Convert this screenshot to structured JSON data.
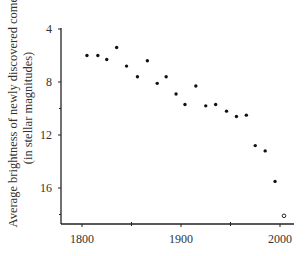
{
  "chart_data": {
    "type": "scatter",
    "title": "",
    "xlabel": "",
    "ylabel": "Average brightness of newly discovered comets (in stellar magnitudes)",
    "ylabel_lines": [
      "Average brightness of newly discovered comets",
      "(in stellar magnitudes)"
    ],
    "x_ticks": [
      1800,
      1900,
      2000
    ],
    "x_minor_ticks": [
      1850,
      1950
    ],
    "y_ticks": [
      4,
      8,
      12,
      16
    ],
    "y_minor_ticks": [
      10,
      18
    ],
    "y_inverted": true,
    "xlim": [
      1779,
      2014
    ],
    "ylim": [
      4,
      18.8
    ],
    "grid": false,
    "legend": null,
    "series": [
      {
        "name": "observed",
        "marker": "filled-circle",
        "points": [
          {
            "x": 1805,
            "y": 6.0
          },
          {
            "x": 1816,
            "y": 6.0
          },
          {
            "x": 1825,
            "y": 6.3
          },
          {
            "x": 1835,
            "y": 5.4
          },
          {
            "x": 1845,
            "y": 6.8
          },
          {
            "x": 1856,
            "y": 7.6
          },
          {
            "x": 1866,
            "y": 6.4
          },
          {
            "x": 1876,
            "y": 8.1
          },
          {
            "x": 1885,
            "y": 7.6
          },
          {
            "x": 1895,
            "y": 8.9
          },
          {
            "x": 1904,
            "y": 9.7
          },
          {
            "x": 1915,
            "y": 8.3
          },
          {
            "x": 1925,
            "y": 9.8
          },
          {
            "x": 1935,
            "y": 9.7
          },
          {
            "x": 1946,
            "y": 10.2
          },
          {
            "x": 1956,
            "y": 10.6
          },
          {
            "x": 1966,
            "y": 10.5
          },
          {
            "x": 1975,
            "y": 12.8
          },
          {
            "x": 1985,
            "y": 13.2
          },
          {
            "x": 1995,
            "y": 15.5
          }
        ]
      },
      {
        "name": "projected",
        "marker": "open-circle",
        "points": [
          {
            "x": 2004,
            "y": 18.1
          }
        ]
      }
    ]
  },
  "colors": {
    "axis": "#222222",
    "marker": "#111111",
    "text": "#333333"
  }
}
